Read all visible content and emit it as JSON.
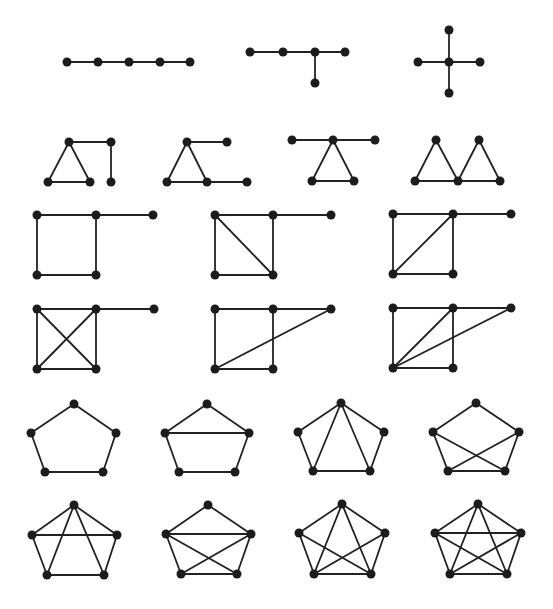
{
  "figure": {
    "style": {
      "edge_color": "#222222",
      "node_color": "#1c1c1c",
      "background": "#ffffff",
      "node_radius": 4.5
    },
    "graphs": [
      {
        "id": "path-p5",
        "nodes": [
          [
            67,
            62
          ],
          [
            98,
            62
          ],
          [
            129,
            62
          ],
          [
            160,
            62
          ],
          [
            190,
            62
          ]
        ],
        "edges": [
          [
            0,
            1
          ],
          [
            1,
            2
          ],
          [
            2,
            3
          ],
          [
            3,
            4
          ]
        ]
      },
      {
        "id": "tree-spider",
        "nodes": [
          [
            250,
            52
          ],
          [
            283,
            52
          ],
          [
            315,
            52
          ],
          [
            345,
            52
          ],
          [
            315,
            83
          ]
        ],
        "edges": [
          [
            0,
            1
          ],
          [
            1,
            2
          ],
          [
            2,
            3
          ],
          [
            2,
            4
          ]
        ]
      },
      {
        "id": "star-k14",
        "nodes": [
          [
            449,
            62
          ],
          [
            449,
            30
          ],
          [
            418,
            62
          ],
          [
            480,
            62
          ],
          [
            449,
            93
          ]
        ],
        "edges": [
          [
            0,
            1
          ],
          [
            0,
            2
          ],
          [
            0,
            3
          ],
          [
            0,
            4
          ]
        ]
      },
      {
        "id": "triangle-path-tail",
        "nodes": [
          [
            69,
            142
          ],
          [
            48,
            182
          ],
          [
            90,
            182
          ],
          [
            111,
            142
          ],
          [
            111,
            182
          ]
        ],
        "edges": [
          [
            0,
            1
          ],
          [
            1,
            2
          ],
          [
            0,
            2
          ],
          [
            0,
            3
          ],
          [
            3,
            4
          ]
        ]
      },
      {
        "id": "triangle-two-pendants",
        "nodes": [
          [
            187,
            142
          ],
          [
            167,
            182
          ],
          [
            207,
            182
          ],
          [
            227,
            142
          ],
          [
            247,
            182
          ]
        ],
        "edges": [
          [
            0,
            1
          ],
          [
            1,
            2
          ],
          [
            0,
            2
          ],
          [
            0,
            3
          ],
          [
            2,
            4
          ]
        ]
      },
      {
        "id": "triangle-two-pendants-same-vertex",
        "nodes": [
          [
            333,
            140
          ],
          [
            312,
            181
          ],
          [
            354,
            181
          ],
          [
            292,
            140
          ],
          [
            375,
            140
          ]
        ],
        "edges": [
          [
            0,
            1
          ],
          [
            1,
            2
          ],
          [
            0,
            2
          ],
          [
            0,
            3
          ],
          [
            0,
            4
          ]
        ]
      },
      {
        "id": "bowtie",
        "nodes": [
          [
            415,
            181
          ],
          [
            436,
            140
          ],
          [
            458,
            181
          ],
          [
            479,
            140
          ],
          [
            500,
            181
          ]
        ],
        "edges": [
          [
            0,
            1
          ],
          [
            1,
            2
          ],
          [
            0,
            2
          ],
          [
            2,
            3
          ],
          [
            3,
            4
          ],
          [
            2,
            4
          ]
        ]
      },
      {
        "id": "square-tail",
        "nodes": [
          [
            37,
            215
          ],
          [
            96,
            215
          ],
          [
            96,
            275
          ],
          [
            37,
            275
          ],
          [
            153,
            215
          ]
        ],
        "edges": [
          [
            0,
            1
          ],
          [
            1,
            2
          ],
          [
            2,
            3
          ],
          [
            3,
            0
          ],
          [
            1,
            4
          ]
        ]
      },
      {
        "id": "square-diag-tail-a",
        "nodes": [
          [
            215,
            215
          ],
          [
            273,
            215
          ],
          [
            273,
            275
          ],
          [
            215,
            275
          ],
          [
            331,
            215
          ]
        ],
        "edges": [
          [
            0,
            1
          ],
          [
            1,
            2
          ],
          [
            2,
            3
          ],
          [
            3,
            0
          ],
          [
            0,
            2
          ],
          [
            1,
            4
          ]
        ]
      },
      {
        "id": "square-diag-tail-b",
        "nodes": [
          [
            393,
            214
          ],
          [
            453,
            214
          ],
          [
            453,
            274
          ],
          [
            393,
            274
          ],
          [
            511,
            214
          ]
        ],
        "edges": [
          [
            0,
            1
          ],
          [
            1,
            2
          ],
          [
            2,
            3
          ],
          [
            3,
            0
          ],
          [
            1,
            3
          ],
          [
            1,
            4
          ]
        ]
      },
      {
        "id": "k4-tail",
        "nodes": [
          [
            37,
            309
          ],
          [
            96,
            309
          ],
          [
            96,
            369
          ],
          [
            37,
            369
          ],
          [
            154,
            309
          ]
        ],
        "edges": [
          [
            0,
            1
          ],
          [
            1,
            2
          ],
          [
            2,
            3
          ],
          [
            3,
            0
          ],
          [
            0,
            2
          ],
          [
            1,
            3
          ],
          [
            1,
            4
          ]
        ]
      },
      {
        "id": "square-long-chord",
        "nodes": [
          [
            215,
            309
          ],
          [
            273,
            309
          ],
          [
            273,
            369
          ],
          [
            215,
            369
          ],
          [
            331,
            309
          ]
        ],
        "edges": [
          [
            0,
            1
          ],
          [
            1,
            2
          ],
          [
            2,
            3
          ],
          [
            3,
            0
          ],
          [
            1,
            4
          ],
          [
            3,
            4
          ]
        ]
      },
      {
        "id": "square-diag-long-chord",
        "nodes": [
          [
            393,
            308
          ],
          [
            453,
            308
          ],
          [
            453,
            368
          ],
          [
            393,
            368
          ],
          [
            511,
            308
          ]
        ],
        "edges": [
          [
            0,
            1
          ],
          [
            1,
            2
          ],
          [
            2,
            3
          ],
          [
            3,
            0
          ],
          [
            1,
            4
          ],
          [
            3,
            1
          ],
          [
            3,
            4
          ]
        ]
      },
      {
        "id": "cycle-c5",
        "nodes": [
          [
            74,
            404
          ],
          [
            116,
            433
          ],
          [
            103,
            472
          ],
          [
            45,
            472
          ],
          [
            31,
            433
          ]
        ],
        "edges": [
          [
            0,
            1
          ],
          [
            1,
            2
          ],
          [
            2,
            3
          ],
          [
            3,
            4
          ],
          [
            4,
            0
          ]
        ]
      },
      {
        "id": "c5-one-chord",
        "nodes": [
          [
            207,
            404
          ],
          [
            249,
            433
          ],
          [
            235,
            472
          ],
          [
            179,
            472
          ],
          [
            165,
            433
          ]
        ],
        "edges": [
          [
            0,
            1
          ],
          [
            1,
            2
          ],
          [
            2,
            3
          ],
          [
            3,
            4
          ],
          [
            4,
            0
          ],
          [
            4,
            1
          ]
        ]
      },
      {
        "id": "c5-two-chords-fan",
        "nodes": [
          [
            341,
            403
          ],
          [
            384,
            432
          ],
          [
            370,
            471
          ],
          [
            313,
            471
          ],
          [
            298,
            432
          ]
        ],
        "edges": [
          [
            0,
            1
          ],
          [
            1,
            2
          ],
          [
            2,
            3
          ],
          [
            3,
            4
          ],
          [
            4,
            0
          ],
          [
            0,
            3
          ],
          [
            0,
            2
          ]
        ]
      },
      {
        "id": "c5-two-chords-cross",
        "nodes": [
          [
            476,
            403
          ],
          [
            519,
            432
          ],
          [
            505,
            471
          ],
          [
            448,
            471
          ],
          [
            433,
            432
          ]
        ],
        "edges": [
          [
            0,
            1
          ],
          [
            1,
            2
          ],
          [
            2,
            3
          ],
          [
            3,
            4
          ],
          [
            4,
            0
          ],
          [
            4,
            2
          ],
          [
            1,
            3
          ]
        ]
      },
      {
        "id": "c5-three-chords-a",
        "nodes": [
          [
            74,
            505
          ],
          [
            117,
            535
          ],
          [
            104,
            575
          ],
          [
            47,
            575
          ],
          [
            32,
            535
          ]
        ],
        "edges": [
          [
            0,
            1
          ],
          [
            1,
            2
          ],
          [
            2,
            3
          ],
          [
            3,
            4
          ],
          [
            4,
            0
          ],
          [
            4,
            1
          ],
          [
            0,
            3
          ],
          [
            0,
            2
          ]
        ]
      },
      {
        "id": "c5-three-chords-b",
        "nodes": [
          [
            208,
            505
          ],
          [
            251,
            534
          ],
          [
            237,
            574
          ],
          [
            181,
            574
          ],
          [
            166,
            534
          ]
        ],
        "edges": [
          [
            0,
            1
          ],
          [
            1,
            2
          ],
          [
            2,
            3
          ],
          [
            3,
            4
          ],
          [
            4,
            0
          ],
          [
            4,
            1
          ],
          [
            4,
            2
          ],
          [
            1,
            3
          ]
        ]
      },
      {
        "id": "c5-four-chords",
        "nodes": [
          [
            342,
            504
          ],
          [
            385,
            533
          ],
          [
            371,
            574
          ],
          [
            314,
            574
          ],
          [
            299,
            533
          ]
        ],
        "edges": [
          [
            0,
            1
          ],
          [
            1,
            2
          ],
          [
            2,
            3
          ],
          [
            3,
            4
          ],
          [
            4,
            0
          ],
          [
            0,
            3
          ],
          [
            0,
            2
          ],
          [
            4,
            2
          ],
          [
            1,
            3
          ]
        ]
      },
      {
        "id": "complete-k5",
        "nodes": [
          [
            478,
            504
          ],
          [
            521,
            533
          ],
          [
            507,
            574
          ],
          [
            450,
            574
          ],
          [
            435,
            533
          ]
        ],
        "edges": [
          [
            0,
            1
          ],
          [
            1,
            2
          ],
          [
            2,
            3
          ],
          [
            3,
            4
          ],
          [
            4,
            0
          ],
          [
            0,
            2
          ],
          [
            0,
            3
          ],
          [
            1,
            3
          ],
          [
            1,
            4
          ],
          [
            2,
            4
          ]
        ]
      }
    ]
  }
}
